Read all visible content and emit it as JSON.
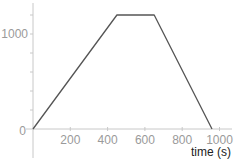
{
  "chart_data": {
    "type": "line",
    "title": "",
    "xlabel": "time (s)",
    "ylabel": "",
    "xlim": [
      0,
      1060
    ],
    "ylim": [
      0,
      1320
    ],
    "x_ticks": [
      0,
      200,
      400,
      600,
      800,
      1000
    ],
    "x_tick_labels": [
      "0",
      "200",
      "400",
      "600",
      "800",
      "1000"
    ],
    "y_ticks": [
      0,
      200,
      400,
      600,
      800,
      1000,
      1200
    ],
    "y_tick_labels": [
      "0",
      "",
      "",
      "",
      "",
      "1000",
      ""
    ],
    "grid": false,
    "legend": null,
    "series": [
      {
        "name": "profile",
        "x": [
          0,
          450,
          650,
          960
        ],
        "y": [
          0,
          1200,
          1200,
          0
        ],
        "color": "#555555"
      }
    ]
  },
  "colors": {
    "axis": "#c8c8c8",
    "tick_label": "#9a9a9a",
    "line": "#555555",
    "axis_title": "#222222"
  }
}
